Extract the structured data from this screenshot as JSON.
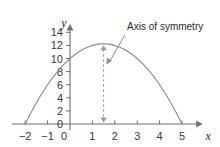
{
  "chart_data": {
    "type": "line",
    "title": "",
    "xlabel": "x",
    "ylabel": "y",
    "xlim": [
      -2.6,
      5.9
    ],
    "ylim": [
      -1.2,
      15.2
    ],
    "x_ticks": [
      "−2",
      "−1",
      "0",
      "1",
      "2",
      "3",
      "4",
      "5"
    ],
    "x_tick_values": [
      -2,
      -1,
      0,
      1,
      2,
      3,
      4,
      5
    ],
    "y_ticks": [
      "0",
      "2",
      "4",
      "6",
      "8",
      "10",
      "12",
      "14"
    ],
    "y_tick_values": [
      0,
      2,
      4,
      6,
      8,
      10,
      12,
      14
    ],
    "grid": false,
    "legend": "none",
    "curve": {
      "name": "parabola",
      "equation": "y = -(x + 2)(x - 5)",
      "roots": [
        -2,
        5
      ],
      "vertex": [
        1.5,
        12.25
      ],
      "y_intercept": 10,
      "color": "#8a8a8a",
      "points": [
        [
          -2,
          0
        ],
        [
          -1.75,
          1.69
        ],
        [
          -1.5,
          3.25
        ],
        [
          -1.25,
          4.69
        ],
        [
          -1,
          6
        ],
        [
          -0.75,
          7.19
        ],
        [
          -0.5,
          8.25
        ],
        [
          -0.25,
          9.19
        ],
        [
          0,
          10
        ],
        [
          0.25,
          10.69
        ],
        [
          0.5,
          11.25
        ],
        [
          0.75,
          11.69
        ],
        [
          1,
          12
        ],
        [
          1.25,
          12.19
        ],
        [
          1.5,
          12.25
        ],
        [
          1.75,
          12.19
        ],
        [
          2,
          12
        ],
        [
          2.25,
          11.69
        ],
        [
          2.5,
          11.25
        ],
        [
          2.75,
          10.69
        ],
        [
          3,
          10
        ],
        [
          3.25,
          9.19
        ],
        [
          3.5,
          8.25
        ],
        [
          3.75,
          7.19
        ],
        [
          4,
          6
        ],
        [
          4.25,
          4.69
        ],
        [
          4.5,
          3.25
        ],
        [
          4.75,
          1.69
        ],
        [
          5,
          0
        ]
      ]
    },
    "annotations": [
      {
        "name": "axis-of-symmetry",
        "label": "Axis of symmetry",
        "line_x": 1.5,
        "line_style": "dashed",
        "line_color": "#9a9a9a",
        "arrowheads": "both",
        "text_position": [
          2.55,
          14.4
        ],
        "leader_from": [
          2.45,
          13.6
        ],
        "leader_to": [
          1.62,
          9.1
        ]
      }
    ]
  },
  "colors": {
    "axis": "#6e6e6e",
    "curve": "#8a8a8a",
    "dashed": "#9a9a9a",
    "text": "#2b2b2b",
    "tick_text": "#3a3a3a",
    "background": "#ffffff"
  }
}
